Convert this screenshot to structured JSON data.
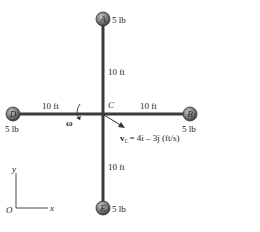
{
  "diagram": {
    "center": {
      "label": "C"
    },
    "balls": [
      {
        "id": "A",
        "label": "A",
        "weight": "5 lb"
      },
      {
        "id": "B",
        "label": "B",
        "weight": "5 lb"
      },
      {
        "id": "D",
        "label": "D",
        "weight": "5 lb"
      },
      {
        "id": "E",
        "label": "E",
        "weight": "5 lb"
      }
    ],
    "rod_lengths": {
      "up": "10 ft",
      "down": "10 ft",
      "left": "10 ft",
      "right": "10 ft"
    },
    "angular_velocity": {
      "symbol": "ω"
    },
    "velocity": {
      "symbol": "v",
      "subscript": "C",
      "expression": "= 4i – 3j (ft/s)"
    },
    "axes": {
      "origin": "O",
      "x": "x",
      "y": "y"
    },
    "colors": {
      "rod": "#3a3a3a",
      "ball": "#7a7a7a",
      "text": "#222222"
    }
  }
}
